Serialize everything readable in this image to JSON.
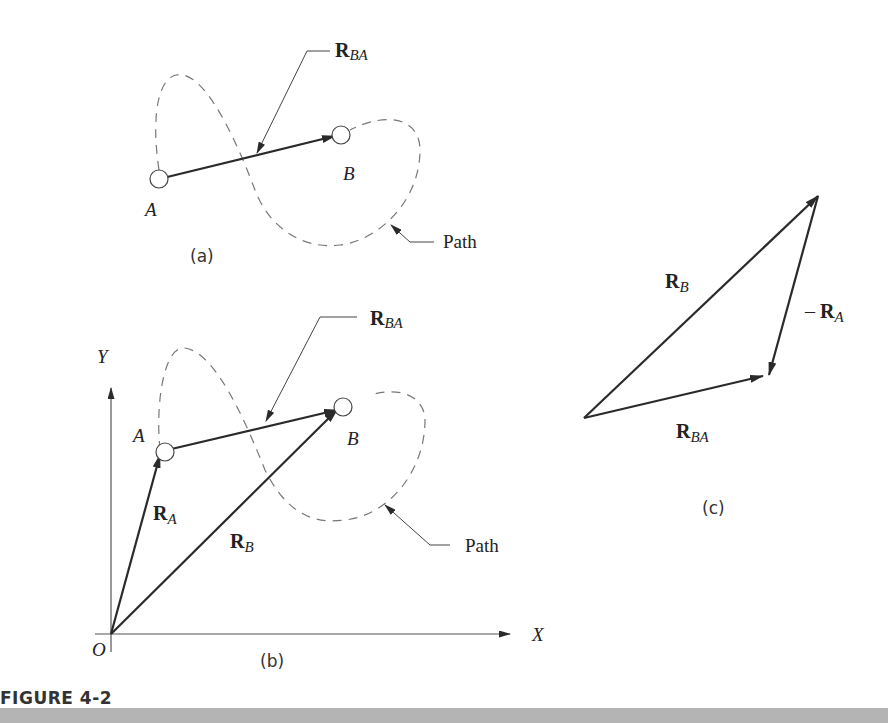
{
  "figure": {
    "caption": "FIGURE 4-2",
    "accent_bar_color": "#b4b4b4"
  },
  "panel_a": {
    "label": "(a)",
    "point_A": "A",
    "point_B": "B",
    "vector_label": {
      "main": "R",
      "sub": "BA"
    },
    "path_label": "Path"
  },
  "panel_b": {
    "label": "(b)",
    "axis_x": "X",
    "axis_y": "Y",
    "origin": "O",
    "point_A": "A",
    "point_B": "B",
    "vector_RA": {
      "main": "R",
      "sub": "A"
    },
    "vector_RB": {
      "main": "R",
      "sub": "B"
    },
    "vector_RBA": {
      "main": "R",
      "sub": "BA"
    },
    "path_label": "Path"
  },
  "panel_c": {
    "label": "(c)",
    "vector_RB": {
      "main": "R",
      "sub": "B"
    },
    "vector_negRA": {
      "prefix": "– ",
      "main": "R",
      "sub": "A"
    },
    "vector_RBA": {
      "main": "R",
      "sub": "BA"
    }
  }
}
